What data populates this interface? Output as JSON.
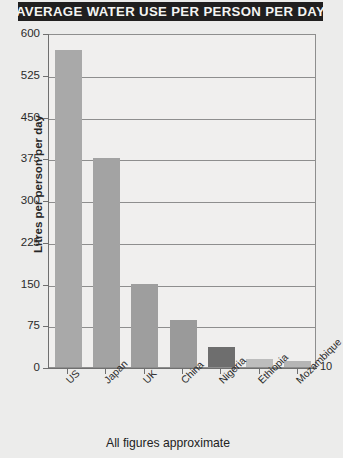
{
  "title": "AVERAGE WATER USE PER PERSON PER DAY",
  "footnote": "All figures approximate",
  "side_value_label": "10",
  "colors": {
    "banner_bg": "#201f1f",
    "banner_text": "#f4f4f2",
    "page_bg": "#ececeb",
    "plot_bg": "#f0efee",
    "grid": "#8e8e8e",
    "bar_light": "#a9a9a9",
    "bar_mid": "#9a9a9a",
    "bar_dark": "#6e6e6e",
    "bar_pale": "#bdbdbd"
  },
  "chart_data": {
    "type": "bar",
    "title": "AVERAGE WATER USE PER PERSON PER DAY",
    "xlabel": "",
    "ylabel": "Litres per person per day",
    "ylim": [
      0,
      600
    ],
    "yticks": [
      0,
      75,
      150,
      225,
      300,
      375,
      450,
      525,
      600
    ],
    "ytick_labels": [
      "0",
      "75",
      "150",
      "225",
      "300",
      "375",
      "450",
      "525",
      "600"
    ],
    "grid": true,
    "legend": false,
    "annotations": [
      "10",
      "All figures approximate"
    ],
    "categories": [
      "US",
      "Japan",
      "UK",
      "China",
      "Nigeria",
      "Ethiopia",
      "Mozambique"
    ],
    "values": [
      570,
      375,
      150,
      85,
      36,
      15,
      10
    ],
    "bar_colors": [
      "#a9a9a9",
      "#a3a3a3",
      "#9e9e9e",
      "#9a9a9a",
      "#6e6e6e",
      "#bdbdbd",
      "#b5b5b5"
    ]
  }
}
